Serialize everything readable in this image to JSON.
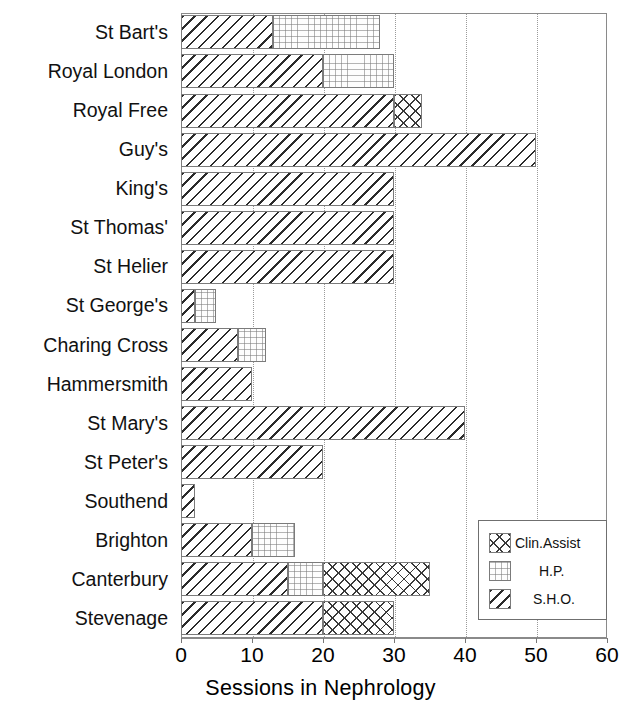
{
  "chart_data": {
    "type": "bar",
    "orientation": "horizontal",
    "stacked": true,
    "title": "",
    "xlabel": "Sessions in Nephrology",
    "ylabel": "",
    "xlim": [
      0,
      60
    ],
    "xticks": [
      0,
      10,
      20,
      30,
      40,
      50,
      60
    ],
    "xtick_labels": [
      "0",
      "10",
      "20",
      "30",
      "40",
      "50",
      "60"
    ],
    "grid": "vertical-dotted",
    "legend_position": "bottom-right",
    "categories": [
      "St Bart's",
      "Royal London",
      "Royal Free",
      "Guy's",
      "King's",
      "St Thomas'",
      "St Helier",
      "St George's",
      "Charing Cross",
      "Hammersmith",
      "St Mary's",
      "St Peter's",
      "Southend",
      "Brighton",
      "Canterbury",
      "Stevenage"
    ],
    "series": [
      {
        "name": "S.H.O.",
        "pattern": "diagonal-hatch",
        "values": [
          13,
          20,
          30,
          50,
          30,
          30,
          30,
          2,
          8,
          10,
          40,
          20,
          2,
          10,
          15,
          20
        ]
      },
      {
        "name": "H.P.",
        "pattern": "dotted",
        "values": [
          15,
          10,
          0,
          0,
          0,
          0,
          0,
          3,
          4,
          0,
          0,
          0,
          0,
          6,
          5,
          0
        ]
      },
      {
        "name": "Clin.Assist",
        "pattern": "cross-hatch",
        "values": [
          0,
          0,
          4,
          0,
          0,
          0,
          0,
          0,
          0,
          0,
          0,
          0,
          0,
          0,
          15,
          10
        ]
      }
    ],
    "totals": [
      28,
      30,
      34,
      50,
      30,
      30,
      30,
      5,
      12,
      10,
      40,
      20,
      2,
      16,
      35,
      30
    ]
  },
  "legend": {
    "items": [
      {
        "label": "Clin.Assist",
        "pattern": "cross-hatch"
      },
      {
        "label": "H.P.",
        "pattern": "dotted"
      },
      {
        "label": "S.H.O.",
        "pattern": "diagonal-hatch"
      }
    ]
  },
  "colors": {
    "background": "#ffffff",
    "ink": "#000000",
    "frame": "#8a8a8a",
    "grid": "#9a9a9a",
    "hatch": "#2b2b2b"
  }
}
